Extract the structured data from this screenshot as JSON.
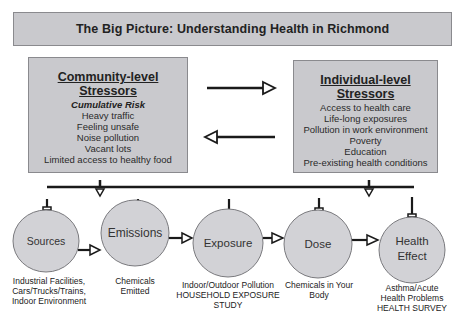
{
  "title": "The Big Picture: Understanding Health in Richmond",
  "community": {
    "heading": "Community-level Stressors",
    "subheading": "Cumulative Risk",
    "items": [
      "Heavy traffic",
      "Feeling unsafe",
      "Noise pollution",
      "Vacant lots",
      "Limited access to healthy food"
    ]
  },
  "individual": {
    "heading": "Individual-level Stressors",
    "items": [
      "Access to health care",
      "Life-long exposures",
      "Pollution in work environment",
      "Poverty",
      "Education",
      "Pre-existing health conditions"
    ]
  },
  "arrows": {
    "top": "right",
    "bottom": "left"
  },
  "nodes": [
    {
      "label": "Sources",
      "caption": [
        "Industrial Facilities,",
        "Cars/Trucks/Trains,",
        "Indoor Environment"
      ]
    },
    {
      "label": "Emissions",
      "caption": [
        "Chemicals",
        "Emitted"
      ]
    },
    {
      "label": "Exposure",
      "caption": [
        "Indoor/Outdoor Pollution",
        "HOUSEHOLD EXPOSURE",
        "STUDY"
      ]
    },
    {
      "label": "Dose",
      "caption": [
        "Chemicals in Your",
        "Body"
      ]
    },
    {
      "label": "Health",
      "label2": "Effect",
      "caption": [
        "Asthma/Acute",
        "Health Problems",
        "HEALTH SURVEY"
      ]
    }
  ],
  "colors": {
    "box_fill": "#c9c9cd",
    "circle_fill": "#d2d2d6",
    "stroke": "#1a1a1a"
  }
}
